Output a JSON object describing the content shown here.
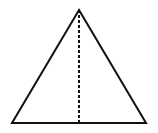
{
  "diagram": {
    "type": "isosceles-triangle-with-altitude",
    "stroke_color": "#111111",
    "background": "#ffffff",
    "apex": [
      79,
      10
    ],
    "base_left": [
      12,
      123
    ],
    "base_right": [
      146,
      123
    ],
    "altitude": {
      "from": [
        79,
        10
      ],
      "to": [
        79,
        123
      ],
      "style": "dashed"
    }
  }
}
